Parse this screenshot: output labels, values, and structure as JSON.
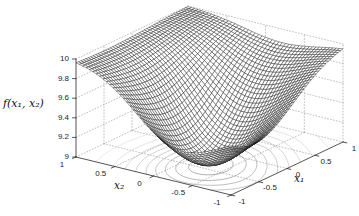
{
  "figure": {
    "background": "#ffffff"
  },
  "chart_data": {
    "type": "surface3d_mesh_with_floor_contours",
    "title": "",
    "legend": false,
    "grid": "dotted",
    "x_axis": {
      "label": "x₁",
      "range": [
        -1,
        1
      ],
      "ticks": [
        "-1",
        "-0.5",
        "0",
        "0.5",
        "1"
      ],
      "tick_values": [
        -1,
        -0.5,
        0,
        0.5,
        1
      ]
    },
    "y_axis": {
      "label": "x₂",
      "range": [
        -1,
        1
      ],
      "ticks": [
        "1",
        "0.5",
        "0",
        "-0.5",
        "-1"
      ],
      "tick_values": [
        1,
        0.5,
        0,
        -0.5,
        -1
      ]
    },
    "z_axis": {
      "label": "f(x₁, x₂)",
      "range": [
        9,
        10
      ],
      "ticks": [
        "9",
        "9.2",
        "9.4",
        "9.6",
        "9.8",
        "10"
      ],
      "tick_values": [
        9,
        9.2,
        9.4,
        9.6,
        9.8,
        10
      ]
    },
    "surface": {
      "formula": "f(x1,x2) = 10 - 0.70*exp(-(1.10*(x1+0.25)^2 + 2.20*(x2+0.20)^2)) - 0.45*exp(-(1.10*(x1+0.70)^2 + 0.80*(x2+0.90)^2))",
      "base": 10,
      "bumps": [
        {
          "amp": 0.7,
          "cx": -0.25,
          "cy": -0.2,
          "kx": 1.1,
          "ky": 2.2
        },
        {
          "amp": 0.45,
          "cx": -0.7,
          "cy": -0.9,
          "kx": 1.1,
          "ky": 0.8
        }
      ],
      "grid_divisions": 46,
      "z_min_approx": 9.03,
      "x1_values": [
        -1,
        -0.5,
        0,
        0.5,
        1
      ],
      "x2_values": [
        -1,
        -0.5,
        0,
        0.5,
        1
      ],
      "f_values": [
        [
          9.5,
          9.33,
          9.44,
          9.79,
          9.96
        ],
        [
          9.41,
          9.09,
          9.18,
          9.69,
          9.95
        ],
        [
          9.58,
          9.23,
          9.26,
          9.72,
          9.96
        ],
        [
          9.82,
          9.61,
          9.61,
          9.85,
          9.98
        ],
        [
          9.95,
          9.88,
          9.88,
          9.95,
          9.99
        ]
      ]
    },
    "contours": {
      "plane_z": 9,
      "levels": [
        9.1,
        9.2,
        9.3,
        9.4,
        9.5,
        9.6,
        9.7,
        9.8,
        9.9
      ]
    },
    "colors": {
      "mesh_line": "#141414",
      "surface_fill": "#ffffff",
      "contour_dark": "#6e6e6e",
      "contour_light": "#c8c8c8",
      "grid_dotted": "#8a8a8a",
      "axis": "#2a2a2a",
      "text": "#1d1d1d"
    }
  }
}
